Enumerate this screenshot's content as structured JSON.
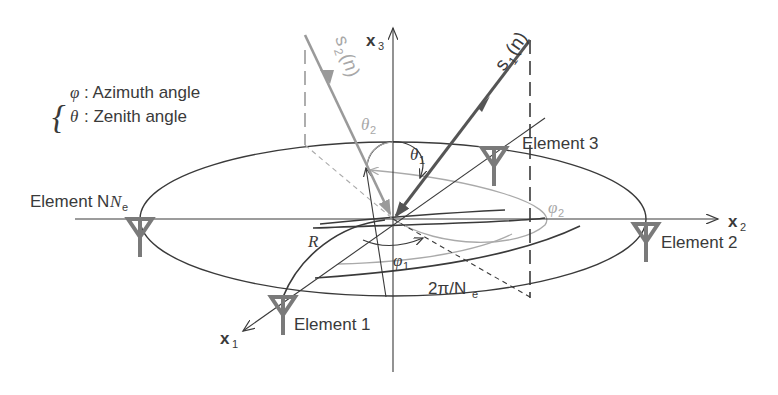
{
  "legend": {
    "phi_symbol": "φ",
    "phi_label": ": Azimuth angle",
    "theta_symbol": "θ",
    "theta_label": ": Zenith angle"
  },
  "axes": {
    "x1": "x",
    "x1_sub": "1",
    "x2": "x",
    "x2_sub": "2",
    "x3": "x",
    "x3_sub": "3"
  },
  "signals": {
    "s1": "s",
    "s1_sub": "1",
    "s1_arg": "(n)",
    "s2": "s",
    "s2_sub": "2",
    "s2_arg": "(n)"
  },
  "angles": {
    "theta1": "θ",
    "theta1_sub": "1",
    "theta2": "θ",
    "theta2_sub": "2",
    "phi1": "φ",
    "phi1_sub": "1",
    "phi2": "φ",
    "phi2_sub": "2",
    "spacing": "2π/N",
    "spacing_sub": "e"
  },
  "radius_label": "R",
  "elements": {
    "e1": "Element 1",
    "e2": "Element 2",
    "e3": "Element 3",
    "eN": "Element N",
    "eN_sub": "e"
  },
  "colors": {
    "dark": "#3a3a3a",
    "signal1": "#555555",
    "signal2": "#a0a0a0",
    "antenna": "#7a7a7a"
  }
}
